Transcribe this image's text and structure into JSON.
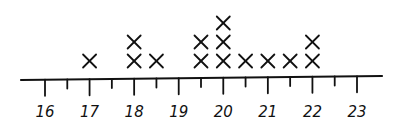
{
  "chart_data": {
    "type": "dot",
    "title": "",
    "xlabel": "",
    "ylabel": "",
    "xlim": [
      16,
      23
    ],
    "tick_step": 0.5,
    "tick_labels": [
      "16",
      "17",
      "18",
      "19",
      "20",
      "21",
      "22",
      "23"
    ],
    "marker": "X",
    "points": [
      {
        "x": 17,
        "count": 1
      },
      {
        "x": 18,
        "count": 2
      },
      {
        "x": 18.5,
        "count": 1
      },
      {
        "x": 19.5,
        "count": 2
      },
      {
        "x": 20,
        "count": 3
      },
      {
        "x": 20.5,
        "count": 1
      },
      {
        "x": 21,
        "count": 1
      },
      {
        "x": 21.5,
        "count": 1
      },
      {
        "x": 22,
        "count": 2
      }
    ],
    "grid": false,
    "legend": null
  },
  "colors": {
    "ink": "#111111",
    "background": "#ffffff"
  }
}
